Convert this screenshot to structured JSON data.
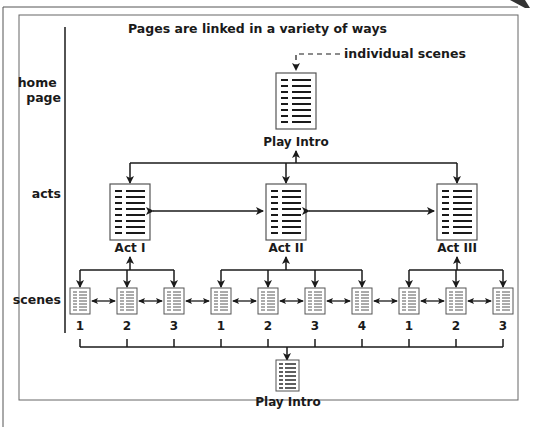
{
  "title": "Pages are linked in a variety of ways",
  "annotation": "individual scenes",
  "levels": {
    "home": [
      "home",
      "page"
    ],
    "acts": "acts",
    "scenes": "scenes"
  },
  "home_page": {
    "label": "Play Intro"
  },
  "acts": [
    {
      "label": "Act I",
      "scenes": [
        "1",
        "2",
        "3"
      ]
    },
    {
      "label": "Act II",
      "scenes": [
        "1",
        "2",
        "3",
        "4"
      ]
    },
    {
      "label": "Act III",
      "scenes": [
        "1",
        "2",
        "3"
      ]
    }
  ],
  "bottom_page": {
    "label": "Play Intro"
  },
  "colors": {
    "line": "#1a1a1a",
    "frame": "#555555",
    "page_fill": "#ffffff"
  }
}
